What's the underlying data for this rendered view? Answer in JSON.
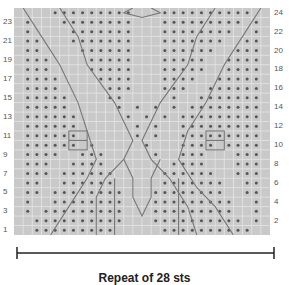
{
  "chart": {
    "cols": 28,
    "rows": 24,
    "cell_bg": "#c9c9c9",
    "grid_line": "#e6e6e6",
    "dot_color": "#555555",
    "cable_line": "#777777",
    "row_labels_left": [
      "1",
      "3",
      "5",
      "7",
      "9",
      "11",
      "13",
      "15",
      "17",
      "19",
      "21",
      "23"
    ],
    "row_labels_right": [
      "2",
      "4",
      "6",
      "8",
      "10",
      "12",
      "14",
      "16",
      "18",
      "20",
      "22",
      "24"
    ],
    "dot_rows_top_to_bottom": [
      "....#########...##########..",
      ".#...########...#########.#.",
      ".#....#######...########..#.",
      ".##...#######...#######..##.",
      ".##....######...######..###.",
      ".###....#####...#####..####.",
      ".###....#####...#####..####.",
      ".####....####...####..#####.",
      ".####.....###...###..######.",
      ".#####....##.....#..#######.",
      ".#####.....#.#.#.#.########.",
      ".######.....#.#.#.#########.",
      ".######......#.#..#########.",
      ".######......#.#..#########.",
      ".######.#.....#...####.####.",
      ".####..###.....#..###...###.",
      ".###..####.......####...###.",
      ".###.######.....######..###.",
      ".##..######.....#######..##.",
      ".##.########...########..##.",
      ".#..########...#########..#.",
      ".#.#########...#########..#.",
      "..##########...##########.#.",
      "..#########.....##########.."
    ],
    "cables": [
      [
        [
          1,
          0
        ],
        [
          3,
          3
        ],
        [
          5,
          6
        ],
        [
          7,
          10
        ],
        [
          8,
          13
        ],
        [
          9,
          16
        ],
        [
          8,
          18
        ],
        [
          6,
          21
        ],
        [
          4,
          24
        ]
      ],
      [
        [
          5,
          0
        ],
        [
          7,
          3
        ],
        [
          8,
          6
        ],
        [
          11,
          10
        ],
        [
          12,
          12
        ],
        [
          13,
          14
        ],
        [
          12,
          16
        ],
        [
          10,
          18
        ],
        [
          9,
          20
        ],
        [
          9,
          24
        ]
      ],
      [
        [
          13,
          0
        ],
        [
          12,
          0.5
        ],
        [
          14,
          1
        ],
        [
          16,
          0.5
        ],
        [
          15,
          0
        ]
      ],
      [
        [
          22,
          0
        ],
        [
          20,
          3
        ],
        [
          19,
          6
        ],
        [
          16,
          10
        ],
        [
          15,
          12
        ],
        [
          14,
          14
        ],
        [
          15,
          16
        ],
        [
          17,
          18
        ],
        [
          19,
          21
        ],
        [
          20,
          24
        ]
      ],
      [
        [
          27,
          0
        ],
        [
          25,
          3
        ],
        [
          23,
          6
        ],
        [
          21,
          10
        ],
        [
          19,
          13
        ],
        [
          18,
          16
        ],
        [
          20,
          19
        ],
        [
          22,
          21
        ],
        [
          24,
          24
        ]
      ],
      [
        [
          12,
          16
        ],
        [
          13,
          18
        ],
        [
          13,
          20
        ],
        [
          14,
          22
        ],
        [
          15,
          20
        ],
        [
          15,
          18
        ],
        [
          16,
          16
        ]
      ],
      [
        [
          11,
          18
        ],
        [
          11,
          24
        ]
      ],
      [
        [
          18,
          18
        ],
        [
          18,
          24
        ]
      ]
    ],
    "boxes": [
      {
        "col": 6,
        "row": 13,
        "w": 2,
        "h": 2
      },
      {
        "col": 21,
        "row": 13,
        "w": 2,
        "h": 2
      }
    ]
  },
  "footer": {
    "repeat_label": "Repeat of 28 sts"
  }
}
